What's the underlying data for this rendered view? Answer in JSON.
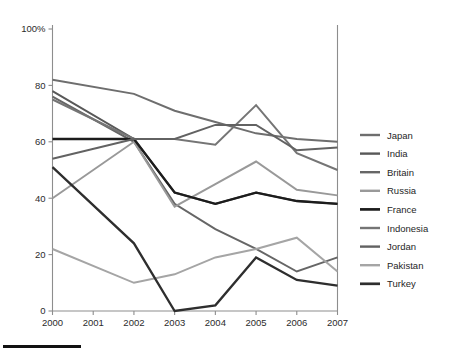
{
  "chart_data": {
    "type": "line",
    "title": "",
    "subtitle": "",
    "xlabel": "",
    "ylabel": "",
    "x": [
      2000,
      2001,
      2002,
      2003,
      2004,
      2005,
      2006,
      2007
    ],
    "categories": [
      "2000",
      "2001",
      "2002",
      "2003",
      "2004",
      "2005",
      "2006",
      "2007"
    ],
    "xtick_labels": [
      "2000",
      "2001",
      "2002",
      "2003",
      "2004",
      "2005",
      "2006",
      "2007"
    ],
    "ytick_labels": [
      "0",
      "20",
      "40",
      "60",
      "80",
      "100%"
    ],
    "ytick_values": [
      0,
      20,
      40,
      60,
      80,
      100
    ],
    "ylim": [
      0,
      100
    ],
    "xlim": [
      2000,
      2007
    ],
    "grid": false,
    "legend_position": "right",
    "series": [
      {
        "name": "Japan",
        "color": "#6e6e6e",
        "width": 2.0,
        "x": [
          2000,
          2002,
          2003,
          2004,
          2005,
          2006,
          2007
        ],
        "values": [
          82,
          77,
          71,
          67,
          63,
          61,
          60
        ]
      },
      {
        "name": "India",
        "color": "#585858",
        "width": 2.0,
        "x": [
          2000,
          2002,
          2003,
          2004,
          2005,
          2006,
          2007
        ],
        "values": [
          78,
          61,
          42,
          38,
          42,
          39,
          38
        ]
      },
      {
        "name": "Britain",
        "color": "#666666",
        "width": 2.0,
        "x": [
          2000,
          2002,
          2003,
          2004,
          2005,
          2006,
          2007
        ],
        "values": [
          76,
          60,
          38,
          29,
          22,
          14,
          19
        ]
      },
      {
        "name": "Russia",
        "color": "#999999",
        "width": 2.0,
        "x": [
          2000,
          2002,
          2003,
          2004,
          2005,
          2006,
          2007
        ],
        "values": [
          40,
          60,
          37,
          45,
          53,
          43,
          41
        ]
      },
      {
        "name": "France",
        "color": "#1c1c1c",
        "width": 2.3,
        "x": [
          2000,
          2002,
          2003,
          2004,
          2005,
          2006,
          2007
        ],
        "values": [
          61,
          61,
          42,
          38,
          42,
          39,
          38
        ]
      },
      {
        "name": "Indonesia",
        "color": "#757575",
        "width": 2.0,
        "x": [
          2000,
          2002,
          2003,
          2004,
          2005,
          2006,
          2007
        ],
        "values": [
          75,
          61,
          61,
          59,
          73,
          56,
          50
        ]
      },
      {
        "name": "Jordan",
        "color": "#626262",
        "width": 2.0,
        "x": [
          2000,
          2002,
          2003,
          2004,
          2005,
          2006,
          2007
        ],
        "values": [
          54,
          61,
          61,
          66,
          66,
          57,
          58
        ]
      },
      {
        "name": "Pakistan",
        "color": "#a5a5a5",
        "width": 2.0,
        "x": [
          2000,
          2002,
          2003,
          2004,
          2005,
          2006,
          2007
        ],
        "values": [
          22,
          10,
          13,
          19,
          22,
          26,
          14
        ]
      },
      {
        "name": "Turkey",
        "color": "#2e2e2e",
        "width": 2.3,
        "x": [
          2000,
          2002,
          2003,
          2004,
          2005,
          2006,
          2007
        ],
        "values": [
          51,
          24,
          0,
          2,
          19,
          11,
          9
        ]
      }
    ]
  },
  "legend": {
    "entries": [
      {
        "label": "Japan"
      },
      {
        "label": "India"
      },
      {
        "label": "Britain"
      },
      {
        "label": "Russia"
      },
      {
        "label": "France"
      },
      {
        "label": "Indonesia"
      },
      {
        "label": "Jordan"
      },
      {
        "label": "Pakistan"
      },
      {
        "label": "Turkey"
      }
    ]
  }
}
